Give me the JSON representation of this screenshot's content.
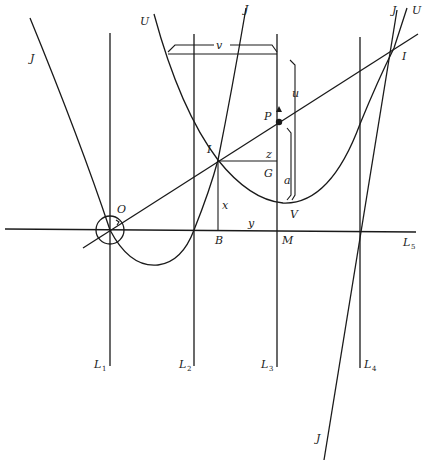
{
  "diagram": {
    "type": "geometric construction",
    "curves": {
      "J_left": "J",
      "U_top": "U",
      "J_mid": "J",
      "J_right": "J",
      "U_right": "U",
      "J_bottom": "J"
    },
    "points": {
      "O": "O",
      "I_left": "I",
      "I_right": "I",
      "P": "P",
      "G": "G",
      "V": "V",
      "B": "B",
      "M": "M"
    },
    "segments": {
      "v": "v",
      "u": "u",
      "z": "z",
      "a": "a",
      "x": "x",
      "y": "y"
    },
    "lines": {
      "L1": {
        "base": "L",
        "sub": "1"
      },
      "L2": {
        "base": "L",
        "sub": "2"
      },
      "L3": {
        "base": "L",
        "sub": "3"
      },
      "L4": {
        "base": "L",
        "sub": "4"
      },
      "L5": {
        "base": "L",
        "sub": "5"
      }
    }
  }
}
